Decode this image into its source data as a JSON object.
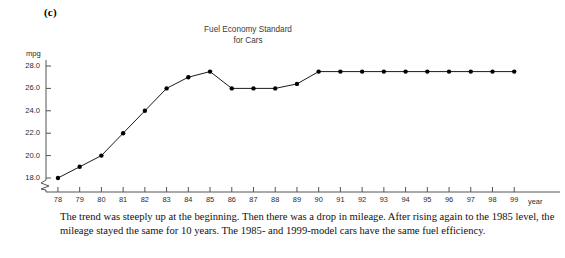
{
  "figure_label": "(c)",
  "chart_data": {
    "type": "line",
    "title": "Fuel Economy Standard for Cars",
    "title_lines": [
      "Fuel Economy Standard",
      "for Cars"
    ],
    "xlabel": "year",
    "ylabel": "mpg",
    "ylim": [
      17.0,
      28.6
    ],
    "y_ticks": [
      "18.0",
      "20.0",
      "22.0",
      "24.0",
      "26.0",
      "28.0"
    ],
    "y_tick_values": [
      18.0,
      20.0,
      22.0,
      24.0,
      26.0,
      28.0
    ],
    "y_axis_break": true,
    "grid": false,
    "legend": "none",
    "marker": "filled-circle",
    "line_color": "#000000",
    "marker_color": "#000000",
    "categories": [
      "78",
      "79",
      "80",
      "81",
      "82",
      "83",
      "84",
      "85",
      "86",
      "87",
      "88",
      "89",
      "90",
      "91",
      "92",
      "93",
      "94",
      "95",
      "96",
      "97",
      "98",
      "99"
    ],
    "x": [
      78,
      79,
      80,
      81,
      82,
      83,
      84,
      85,
      86,
      87,
      88,
      89,
      90,
      91,
      92,
      93,
      94,
      95,
      96,
      97,
      98,
      99
    ],
    "values": [
      18.0,
      19.0,
      20.0,
      22.0,
      24.0,
      26.0,
      27.0,
      27.5,
      26.0,
      26.0,
      26.0,
      26.4,
      27.5,
      27.5,
      27.5,
      27.5,
      27.5,
      27.5,
      27.5,
      27.5,
      27.5,
      27.5
    ],
    "series": [
      {
        "name": "Fuel Economy Standard for Cars",
        "values": [
          18.0,
          19.0,
          20.0,
          22.0,
          24.0,
          26.0,
          27.0,
          27.5,
          26.0,
          26.0,
          26.0,
          26.4,
          27.5,
          27.5,
          27.5,
          27.5,
          27.5,
          27.5,
          27.5,
          27.5,
          27.5,
          27.5
        ]
      }
    ]
  },
  "caption": "The trend was steeply up at the beginning. Then there was a drop in mileage. After rising again to the 1985 level, the mileage stayed the same for 10 years. The 1985- and 1999-model cars have the same fuel efficiency."
}
